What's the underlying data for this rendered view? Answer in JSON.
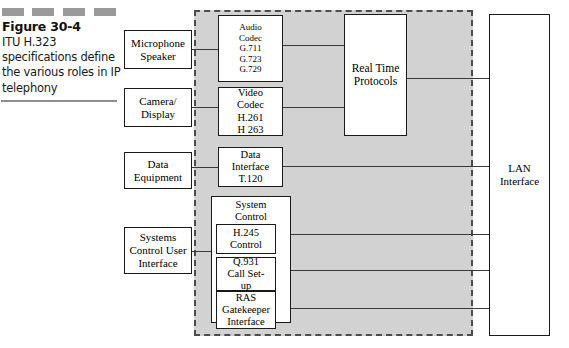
{
  "figure": {
    "number": "Figure 30-4",
    "caption": "ITU H.323 specifications define the various roles in IP telephony",
    "decor_label": "decorative-dashes"
  },
  "boxes": {
    "microphone_speaker": {
      "lines": [
        "Microphone",
        "Speaker"
      ]
    },
    "camera_display": {
      "lines": [
        "Camera/",
        "Display"
      ]
    },
    "data_equipment": {
      "lines": [
        "Data",
        "Equipment"
      ]
    },
    "systems_control_ui": {
      "lines": [
        "Systems",
        "Control User",
        "Interface"
      ]
    },
    "audio_codec": {
      "lines": [
        "Audio",
        "Codec",
        "G.711",
        "G.723",
        "G.729"
      ]
    },
    "video_codec": {
      "lines": [
        "Video",
        "Codec",
        "H.261",
        "H 263"
      ]
    },
    "data_interface": {
      "lines": [
        "Data",
        "Interface",
        "T.120"
      ]
    },
    "real_time_protocols": {
      "lines": [
        "Real Time",
        "Protocols"
      ]
    },
    "lan_interface": {
      "lines": [
        "LAN",
        "Interface"
      ]
    },
    "system_control": {
      "lines": [
        "System",
        "Control"
      ]
    },
    "h245_control": {
      "lines": [
        "H.245",
        "Control"
      ]
    },
    "q931_call_setup": {
      "lines": [
        "Q.931",
        "Call Set-",
        "up"
      ]
    },
    "ras_gatekeeper": {
      "lines": [
        "RAS",
        "Gatekeeper",
        "Interface"
      ]
    }
  },
  "colors": {
    "terminal_fill": "#d2d2d2",
    "terminal_border": "#4c4c4c",
    "line": "#3a3a3a",
    "dash_decor": "#9a9a9a",
    "box_fill": "#ffffff",
    "box_border": "#1a1a1a"
  }
}
